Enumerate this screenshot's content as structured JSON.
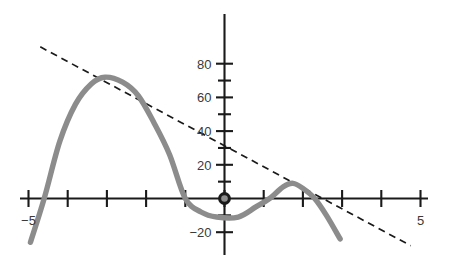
{
  "chart_data": {
    "type": "line",
    "title": "",
    "subtitle": "",
    "xlabel": "",
    "ylabel": "",
    "xlim": [
      -5.55,
      5.75
    ],
    "ylim": [
      -27,
      92
    ],
    "grid": false,
    "legend": null,
    "x_ticks": [
      -5,
      -4,
      -3,
      -2,
      -1,
      0,
      1,
      2,
      3,
      4,
      5
    ],
    "x_tick_labels": [
      "−5",
      "",
      "",
      "",
      "",
      "",
      "",
      "",
      "",
      "",
      "5"
    ],
    "y_ticks": [
      -20,
      -10,
      10,
      20,
      30,
      40,
      50,
      60,
      70,
      80
    ],
    "y_tick_labels": [
      "−20",
      "",
      "",
      "20",
      "",
      "40",
      "",
      "60",
      "",
      "80"
    ],
    "y_major_ticks": [
      -20,
      20,
      40,
      60,
      80
    ],
    "origin_marker": {
      "x": 0,
      "y": 0,
      "label": ""
    },
    "series": [
      {
        "name": "cubic-curve",
        "type": "curve",
        "color": "#8c8c8c",
        "style": "solid",
        "roots": [
          -4.6,
          -1.0,
          2.3
        ],
        "local_max": {
          "x": -3.05,
          "y": 72
        },
        "local_min": {
          "x": 0.35,
          "y": -11
        },
        "local_max_2": {
          "x": 1.75,
          "y": 9
        },
        "points": [
          {
            "x": -4.95,
            "y": -26
          },
          {
            "x": -4.6,
            "y": 0
          },
          {
            "x": -4.2,
            "y": 34
          },
          {
            "x": -3.8,
            "y": 56
          },
          {
            "x": -3.4,
            "y": 68
          },
          {
            "x": -3.05,
            "y": 72
          },
          {
            "x": -2.6,
            "y": 69
          },
          {
            "x": -2.2,
            "y": 61
          },
          {
            "x": -1.8,
            "y": 45
          },
          {
            "x": -1.4,
            "y": 26
          },
          {
            "x": -1.0,
            "y": 0
          },
          {
            "x": -0.6,
            "y": -8
          },
          {
            "x": -0.2,
            "y": -11
          },
          {
            "x": 0.35,
            "y": -11
          },
          {
            "x": 0.8,
            "y": -5
          },
          {
            "x": 1.15,
            "y": 0
          },
          {
            "x": 1.5,
            "y": 7
          },
          {
            "x": 1.75,
            "y": 9
          },
          {
            "x": 2.0,
            "y": 6
          },
          {
            "x": 2.3,
            "y": 0
          },
          {
            "x": 2.6,
            "y": -10
          },
          {
            "x": 2.95,
            "y": -24
          }
        ]
      },
      {
        "name": "secant-line",
        "type": "line",
        "color": "#1a1a1a",
        "style": "dashed",
        "slope": -12.5,
        "intercept": 31.5,
        "endpoints": [
          {
            "x": -4.7,
            "y": 90
          },
          {
            "x": 4.75,
            "y": -28
          }
        ]
      }
    ]
  },
  "figure": {
    "background_color": "#ffffff",
    "axis_color": "#1a1a1a",
    "curve_color": "#8c8c8c",
    "secant_color": "#1a1a1a"
  }
}
